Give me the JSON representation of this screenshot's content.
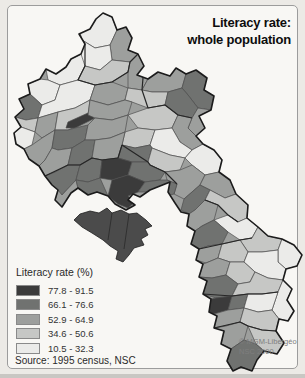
{
  "title": {
    "line1": "Literacy rate:",
    "line2": "whole population"
  },
  "legend": {
    "title": "Literacy rate (%)",
    "classes": [
      {
        "label": "77.8 - 91.5",
        "color": "#3b3b3b"
      },
      {
        "label": "66.1 - 76.6",
        "color": "#707270"
      },
      {
        "label": "52.9 - 64.9",
        "color": "#9d9f9d"
      },
      {
        "label": "34.6 - 50.6",
        "color": "#c6c7c5"
      },
      {
        "label": "10.5 - 32.3",
        "color": "#ebebe9"
      }
    ],
    "source": "Source: 1995 census, NSC"
  },
  "credit": {
    "line1": "© MGM-Libergéo",
    "line2": "NSC 2000"
  },
  "map": {
    "region": "Laos — literacy rate by district, whole population, 1995 census",
    "type": "choropleth",
    "base_fill": "#9d9f9d",
    "district_line": {
      "color": "#4f4f4f",
      "width": 0.7
    },
    "province_line": {
      "color": "#262626",
      "width": 1.2
    },
    "outline_line": {
      "color": "#1c1c1c",
      "width": 1.6
    },
    "outline": "M103,13 L112,17 L117,30 L126,27 L132,38 L128,50 L138,54 L144,66 L137,75 L148,79 L158,72 L170,76 L176,68 L186,74 L196,70 L207,78 L204,90 L214,96 L211,110 L199,116 L205,128 L196,136 L203,144 L214,150 L222,160 L219,172 L230,180 L236,194 L248,205 L247,218 L258,227 L268,236 L282,239 L294,245 L302,255 L297,266 L286,269 L283,280 L292,289 L287,300 L294,311 L288,321 L279,319 L276,331 L284,343 L277,354 L264,351 L257,360 L252,371 L241,367 L233,371 L227,361 L231,349 L221,344 L224,331 L214,328 L217,316 L209,312 L211,299 L203,294 L207,281 L199,277 L203,264 L196,260 L199,249 L191,244 L195,231 L187,226 L189,214 L181,212 L175,203 L168,192 L170,182 L160,186 L150,190 L140,197 L133,194 L128,200 L135,205 L126,210 L115,204 L108,196 L97,192 L88,195 L78,188 L71,193 L62,207 L55,200 L58,190 L52,185 L45,176 L39,166 L29,159 L24,149 L16,144 L14,133 L21,127 L15,117 L24,109 L19,99 L30,94 L28,84 L40,79 L46,69 L56,74 L66,67 L71,59 L81,54 L85,44 L79,34 L90,29 L96,19 Z",
    "cells": [
      {
        "p": "80,13 103,13 112,17 117,30 110,45 95,48 82,40 78,25",
        "c": 4
      },
      {
        "p": "117,30 126,27 132,38 128,50 138,54 130,62 112,60 110,45",
        "c": 2
      },
      {
        "p": "82,40 95,48 110,45 112,60 100,70 85,66 76,55",
        "c": 4
      },
      {
        "p": "46,69 56,74 66,67 71,59 81,54 85,66 78,80 60,85 48,80",
        "c": 4
      },
      {
        "p": "85,66 100,70 112,60 130,62 128,72 112,82 95,85 78,80",
        "c": 3
      },
      {
        "p": "130,62 138,54 144,66 137,75 148,79 142,90 128,88 128,72",
        "c": 2
      },
      {
        "p": "148,79 158,72 170,76 176,68 186,74 182,88 168,92 152,92 142,90",
        "c": 2
      },
      {
        "p": "186,74 196,70 207,78 204,90 214,96 211,110 198,108 188,95 182,88",
        "c": 1
      },
      {
        "p": "28,84 40,79 48,80 60,85 55,100 42,105 30,94",
        "c": 4
      },
      {
        "p": "19,99 30,94 42,105 38,118 26,120 15,117 24,109",
        "c": 1
      },
      {
        "p": "42,105 55,100 60,85 78,80 95,85 90,100 75,108 58,112 38,118",
        "c": 4
      },
      {
        "p": "95,85 112,82 128,88 125,100 108,105 90,100",
        "c": 2
      },
      {
        "p": "128,88 142,90 152,92 168,92 165,105 148,108 132,102 125,100",
        "c": 3
      },
      {
        "p": "168,92 182,88 188,95 198,108 192,118 178,115 165,105",
        "c": 1
      },
      {
        "p": "198,108 211,110 199,116 205,128 196,136 188,128 192,118",
        "c": 2
      },
      {
        "p": "15,117 26,120 38,118 35,132 21,127",
        "c": 3
      },
      {
        "p": "14,133 21,127 35,132 32,145 24,149 16,144",
        "c": 4
      },
      {
        "p": "38,118 58,112 55,130 42,138 35,132",
        "c": 2
      },
      {
        "p": "58,112 75,108 90,100 88,115 80,125 68,130 55,130",
        "c": 3
      },
      {
        "p": "66,128 68,122 88,113 95,118 75,128",
        "c": 0
      },
      {
        "p": "90,100 108,105 125,100 132,102 128,115 112,120 95,118 88,115",
        "c": 2
      },
      {
        "p": "128,115 148,108 165,105 178,115 172,128 155,130 138,128",
        "c": 3
      },
      {
        "p": "178,115 192,118 188,128 196,136 203,144 192,150 180,142 172,128",
        "c": 2
      },
      {
        "p": "24,149 32,145 42,138 55,130 52,148 45,160 39,166 29,159",
        "c": 2
      },
      {
        "p": "55,130 68,130 75,128 88,125 85,140 72,148 58,150 52,148",
        "c": 1
      },
      {
        "p": "88,125 95,118 112,120 128,115 125,132 110,138 95,140 85,140",
        "c": 2
      },
      {
        "p": "125,132 138,128 155,130 150,145 135,148 122,145",
        "c": 3
      },
      {
        "p": "155,130 172,128 180,142 192,150 185,158 170,155 152,148 150,145",
        "c": 4
      },
      {
        "p": "192,150 203,144 214,150 222,160 219,172 205,175 192,165 185,158",
        "c": 4
      },
      {
        "p": "39,166 45,160 52,148 58,150 72,148 68,165 55,172 45,176",
        "c": 2
      },
      {
        "p": "72,148 85,140 95,140 92,158 80,165 68,165",
        "c": 1
      },
      {
        "p": "95,140 110,138 125,132 122,145 118,158 102,160 92,158",
        "c": 2
      },
      {
        "p": "122,145 135,148 150,145 152,148 148,162 132,162 118,158",
        "c": 1
      },
      {
        "p": "152,148 170,155 185,158 180,170 165,172 150,165 148,162",
        "c": 3
      },
      {
        "p": "165,172 180,170 192,165 205,175 200,185 184,199 174,194 177,184 167,180",
        "c": 2
      },
      {
        "p": "45,176 55,172 68,165 80,165 76,180 62,195 52,185",
        "c": 1
      },
      {
        "p": "62,195 76,180 78,188 71,193 62,207 55,200 58,190",
        "c": 2
      },
      {
        "p": "80,165 92,158 102,160 100,178 88,182 76,180",
        "c": 1
      },
      {
        "p": "102,160 118,158 132,162 128,175 112,180 100,178",
        "c": 0
      },
      {
        "p": "132,162 148,162 150,165 165,172 160,180 145,182 128,175",
        "c": 1
      },
      {
        "p": "76,180 88,182 100,178 108,196 97,192 88,195 78,188",
        "c": 1
      },
      {
        "p": "112,180 128,175 145,182 138,192 128,196 135,202 128,208 118,204 108,196",
        "c": 0
      },
      {
        "p": "145,182 160,180 167,180 177,184 174,194 160,198 150,192 138,192",
        "c": 1
      },
      {
        "p": "205,175 219,172 230,180 236,194 225,198 210,190 200,185",
        "c": 2
      },
      {
        "p": "184,199 200,185 210,190 205,200 195,210 189,214 181,210",
        "c": 1
      },
      {
        "p": "225,198 236,194 248,205 247,218 238,222 228,215 218,205 205,200 210,190",
        "c": 3
      },
      {
        "p": "189,214 195,210 205,200 218,205 214,220 202,226 195,231 187,226",
        "c": 2
      },
      {
        "p": "214,220 228,215 238,222 247,218 258,227 252,238 240,240 228,232",
        "c": 4
      },
      {
        "p": "195,231 202,226 214,220 228,232 222,244 208,246 199,249 191,244",
        "c": 1
      },
      {
        "p": "240,240 252,238 258,227 268,236 282,239 278,250 262,252 248,252",
        "c": 3
      },
      {
        "p": "282,239 294,245 302,255 297,266 286,269 278,262 278,250",
        "c": 4
      },
      {
        "p": "196,260 199,249 208,246 222,244 218,258 206,263",
        "c": 2
      },
      {
        "p": "222,244 240,240 248,252 244,262 230,262 218,258",
        "c": 3
      },
      {
        "p": "244,262 248,252 262,252 278,250 278,262 286,269 283,280 268,278 255,272",
        "c": 4
      },
      {
        "p": "203,264 206,263 218,258 230,262 226,275 212,278 199,277",
        "c": 2
      },
      {
        "p": "226,275 230,262 244,262 255,272 250,282 238,284",
        "c": 3
      },
      {
        "p": "199,277 212,278 226,275 238,284 232,296 216,298 203,294 207,281",
        "c": 1
      },
      {
        "p": "211,299 216,298 232,296 228,310 214,314 209,312",
        "c": 0
      },
      {
        "p": "238,284 250,282 255,272 268,278 283,280 278,292 262,294 248,294 232,296",
        "c": 3
      },
      {
        "p": "283,280 292,289 287,300 294,311 288,321 279,319 272,310 278,292",
        "c": 4
      },
      {
        "p": "232,296 248,294 244,308 228,310",
        "c": 1
      },
      {
        "p": "248,294 262,294 278,292 272,310 258,312 244,308",
        "c": 4
      },
      {
        "p": "209,312 214,314 228,310 244,308 240,322 226,326 214,328 217,316",
        "c": 2
      },
      {
        "p": "244,308 258,312 272,310 279,319 276,331 262,330 248,326 240,322",
        "c": 3
      },
      {
        "p": "214,328 226,326 240,322 248,326 244,340 231,349 221,344 224,331",
        "c": 2
      },
      {
        "p": "248,326 262,330 276,331 284,343 277,354 264,351 256,344",
        "c": 3
      },
      {
        "p": "244,340 256,344 264,351 257,360 252,371 241,367 233,371 227,361 231,349",
        "c": 1
      }
    ],
    "province_borders": [
      "85,44 85,66 78,80 95,85 112,82 128,72 130,62 138,54",
      "144,66 142,90 148,108 165,105 178,115 192,118",
      "45,176 68,165 80,165 92,158 102,160 118,158 122,145",
      "122,145 148,162 150,165 165,172 177,184",
      "205,200 218,205 228,215 238,222",
      "199,249 222,244 240,240 252,238",
      "203,294 232,296 248,294 262,294 278,292",
      "214,328 240,322 248,326 262,330 276,331"
    ],
    "inset_bird": {
      "fill": "#4b4b4b",
      "line": "#1e1e1e",
      "path": "M74,220 L80,214 L90,211 L99,213 L107,208 L112,213 L121,210 L129,214 L137,213 L146,220 L152,226 L145,229 L148,235 L141,239 L144,245 L134,248 L129,255 L123,262 L116,259 L118,251 L110,246 L103,240 L92,233 L82,227 Z",
      "inner_lines": [
        "M112,213 L108,240",
        "M129,214 L124,249"
      ]
    }
  }
}
